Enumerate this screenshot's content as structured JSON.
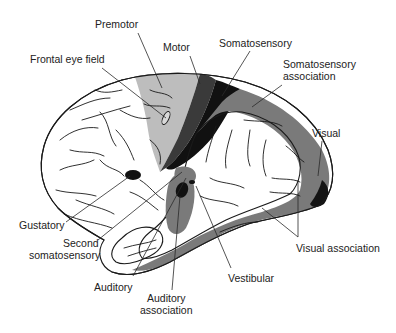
{
  "diagram": {
    "type": "brain-cortical-areas-lateral-view",
    "colors": {
      "background": "#ffffff",
      "outline": "#1a1a1a",
      "premotor": "#bdbdbd",
      "motor": "#3a3a3a",
      "somatosensory": "#111111",
      "somatosensory_association": "#7a7a7a",
      "visual": "#141414",
      "visual_association": "#7a7a7a",
      "auditory_association": "#7a7a7a",
      "small_primary_areas": "#111111",
      "label_text": "#222222"
    },
    "labels": {
      "premotor": "Premotor",
      "motor": "Motor",
      "frontal_eye_field": "Frontal eye field",
      "somatosensory": "Somatosensory",
      "somatosensory_association_line1": "Somatosensory",
      "somatosensory_association_line2": "association",
      "visual": "Visual",
      "visual_association": "Visual association",
      "gustatory": "Gustatory",
      "second_somatosensory_line1": "Second",
      "second_somatosensory_line2": "somatosensory",
      "auditory": "Auditory",
      "auditory_association_line1": "Auditory",
      "auditory_association_line2": "association",
      "vestibular": "Vestibular"
    }
  }
}
